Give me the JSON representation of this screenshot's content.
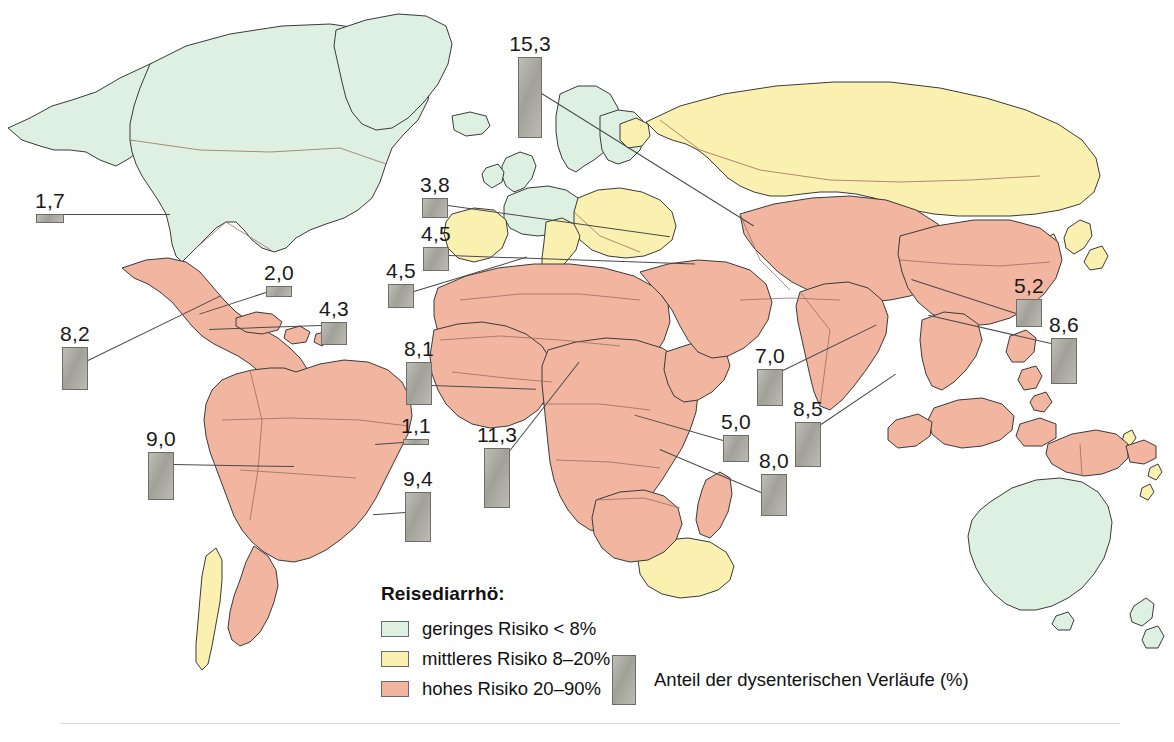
{
  "figure": {
    "bar_unit_px_per_percent": 5.3
  },
  "legend": {
    "title": "Reisediarrhö:",
    "items": [
      {
        "label": "geringes Risiko < 8%",
        "color": "#ddf0e2",
        "region_class": "low"
      },
      {
        "label": "mittleres Risiko 8–20%",
        "color": "#faf0b0",
        "region_class": "medium"
      },
      {
        "label": "hohes Risiko 20–90%",
        "color": "#f2b5a0",
        "region_class": "high"
      }
    ],
    "bar_legend_label": "Anteil der dysenterischen Verläufe (%)",
    "bar_color": "#a9a9a0"
  },
  "colors": {
    "low_risk": "#ddf0e2",
    "medium_risk": "#faf0b0",
    "high_risk": "#f2b5a0",
    "bar": "#a9a9a0",
    "bar_border": "#6e6e66",
    "coastline": "#3a3a3a",
    "border": "#8a6a60",
    "background": "#ffffff"
  },
  "chart_data": {
    "type": "bar",
    "title": "Anteil der dysenterischen Verläufe (%)",
    "xlabel": "",
    "ylabel": "Anteil der dysenterischen Verläufe (%)",
    "ylim": [
      0,
      16
    ],
    "grid": false,
    "legend_position": "bottom-center",
    "categories": [
      "Nordamerika",
      "Osteuropa / Türkei",
      "Westeuropa",
      "Mittelmeer",
      "Nordwestafrika",
      "Mexiko / Mittelamerika",
      "Bahamas",
      "Karibik",
      "Westafrika",
      "Zentralafrika",
      "Äquatorialafrika",
      "Südliches Afrika",
      "Ostafrika",
      "Indien",
      "Sri Lanka",
      "Peru / Anden",
      "Brasilien",
      "Ostasien",
      "Südostasien / Philippinen"
    ],
    "values": [
      1.7,
      15.3,
      3.8,
      4.5,
      4.5,
      8.2,
      2.0,
      4.3,
      8.1,
      1.1,
      11.3,
      9.4,
      5.0,
      7.0,
      8.5,
      9.0,
      8.0,
      5.2,
      8.6
    ],
    "value_labels": [
      "1,7",
      "15,3",
      "3,8",
      "4,5",
      "4,5",
      "8,2",
      "2,0",
      "4,3",
      "8,1",
      "1,1",
      "11,3",
      "9,4",
      "5,0",
      "7,0",
      "8,5",
      "9,0",
      "8,0",
      "5,2",
      "8,6"
    ]
  },
  "markers": [
    {
      "id": "m-na",
      "label": "1,7",
      "value": 1.7,
      "left": 36,
      "bottom_y": 223,
      "width": 28,
      "leader": {
        "x": 64,
        "y": 214,
        "len": 106,
        "angle": 0
      }
    },
    {
      "id": "m-eeur",
      "label": "15,3",
      "value": 15.3,
      "left": 518,
      "bottom_y": 138,
      "width": 24,
      "leader": {
        "x": 540,
        "y": 92,
        "len": 252,
        "angle": 32
      }
    },
    {
      "id": "m-weur",
      "label": "3,8",
      "value": 3.8,
      "left": 422,
      "bottom_y": 218,
      "width": 26,
      "leader": {
        "x": 448,
        "y": 205,
        "len": 224,
        "angle": 8
      }
    },
    {
      "id": "m-med",
      "label": "4,5",
      "value": 4.5,
      "left": 423,
      "bottom_y": 271,
      "width": 26,
      "leader": {
        "x": 449,
        "y": 255,
        "len": 246,
        "angle": 2
      }
    },
    {
      "id": "m-nwafr",
      "label": "4,5",
      "value": 4.5,
      "left": 388,
      "bottom_y": 308,
      "width": 26,
      "leader": {
        "x": 414,
        "y": 291,
        "len": 118,
        "angle": -17
      }
    },
    {
      "id": "m-mex",
      "label": "8,2",
      "value": 8.2,
      "left": 62,
      "bottom_y": 390,
      "width": 26,
      "leader": {
        "x": 88,
        "y": 360,
        "len": 148,
        "angle": -26
      }
    },
    {
      "id": "m-bahamas",
      "label": "2,0",
      "value": 2.0,
      "left": 266,
      "bottom_y": 297,
      "width": 26,
      "leader": {
        "x": 266,
        "y": 292,
        "len": 70,
        "angle": 162
      }
    },
    {
      "id": "m-carib",
      "label": "4,3",
      "value": 4.3,
      "left": 321,
      "bottom_y": 345,
      "width": 26,
      "leader": {
        "x": 321,
        "y": 325,
        "len": 112,
        "angle": 178
      }
    },
    {
      "id": "m-wafr",
      "label": "8,1",
      "value": 8.1,
      "left": 406,
      "bottom_y": 405,
      "width": 26,
      "leader": {
        "x": 432,
        "y": 385,
        "len": 104,
        "angle": 2
      }
    },
    {
      "id": "m-cafr",
      "label": "1,1",
      "value": 1.1,
      "left": 403,
      "bottom_y": 445,
      "width": 26,
      "leader": {
        "x": 403,
        "y": 442,
        "len": 28,
        "angle": 176
      }
    },
    {
      "id": "m-eqafr",
      "label": "11,3",
      "value": 11.3,
      "left": 484,
      "bottom_y": 508,
      "width": 26,
      "leader": {
        "x": 510,
        "y": 450,
        "len": 112,
        "angle": -52
      }
    },
    {
      "id": "m-safr",
      "label": "9,4",
      "value": 9.4,
      "left": 405,
      "bottom_y": 542,
      "width": 26,
      "leader": {
        "x": 405,
        "y": 512,
        "len": 32,
        "angle": 176
      }
    },
    {
      "id": "m-eafr",
      "label": "5,0",
      "value": 5.0,
      "left": 723,
      "bottom_y": 462,
      "width": 26,
      "leader": {
        "x": 723,
        "y": 440,
        "len": 92,
        "angle": 196
      }
    },
    {
      "id": "m-india",
      "label": "7,0",
      "value": 7.0,
      "left": 757,
      "bottom_y": 406,
      "width": 26,
      "leader": {
        "x": 783,
        "y": 370,
        "len": 104,
        "angle": -26
      }
    },
    {
      "id": "m-srilanka",
      "label": "8,5",
      "value": 8.5,
      "left": 795,
      "bottom_y": 467,
      "width": 26,
      "leader": {
        "x": 821,
        "y": 424,
        "len": 90,
        "angle": -34
      }
    },
    {
      "id": "m-peru",
      "label": "9,0",
      "value": 9.0,
      "left": 148,
      "bottom_y": 500,
      "width": 26,
      "leader": {
        "x": 174,
        "y": 464,
        "len": 120,
        "angle": 1
      }
    },
    {
      "id": "m-brazil",
      "label": "8,0",
      "value": 8.0,
      "left": 761,
      "bottom_y": 516,
      "width": 26,
      "leader": {
        "x": 761,
        "y": 492,
        "len": 110,
        "angle": 203
      }
    },
    {
      "id": "m-easia",
      "label": "5,2",
      "value": 5.2,
      "left": 1016,
      "bottom_y": 327,
      "width": 26,
      "leader": {
        "x": 1016,
        "y": 313,
        "len": 110,
        "angle": 198
      }
    },
    {
      "id": "m-seasia",
      "label": "8,6",
      "value": 8.6,
      "left": 1051,
      "bottom_y": 384,
      "width": 26,
      "leader": {
        "x": 1051,
        "y": 343,
        "len": 126,
        "angle": 193
      }
    }
  ]
}
